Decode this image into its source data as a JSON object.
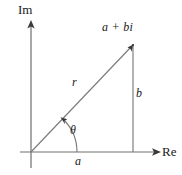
{
  "figure": {
    "kind": "argand-diagram",
    "background_color": "#ffffff",
    "line_color": "#666666",
    "text_color": "#1a1a1a"
  },
  "axes": {
    "imaginary_label": "Im",
    "real_label": "Re",
    "origin": {
      "x": 31,
      "y": 152
    },
    "imaginary_axis": {
      "x": 31,
      "y_top": 21,
      "y_bottom": 168
    },
    "real_axis": {
      "y": 152,
      "x_left": 20,
      "x_right": 160
    }
  },
  "labels": {
    "point": "a + bi",
    "modulus": "r",
    "imaginary_part": "b",
    "real_part": "a",
    "angle": "θ"
  },
  "geometry": {
    "point_coordinates": {
      "x": 133,
      "y": 45
    },
    "hypotenuse": {
      "x1": 31,
      "y1": 152,
      "x2": 133,
      "y2": 45
    },
    "vertical_leg": {
      "x1": 133,
      "y1": 45,
      "x2": 133,
      "y2": 152
    },
    "horizontal_leg": {
      "x1": 31,
      "y1": 152,
      "x2": 133,
      "y2": 152
    },
    "angle_arc_radius": 46
  }
}
